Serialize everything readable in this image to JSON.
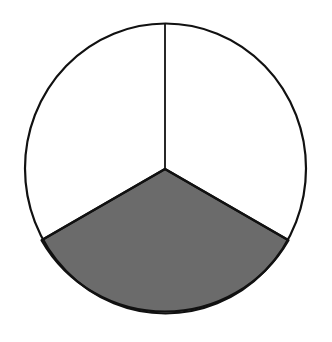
{
  "diagram": {
    "type": "fraction-circle",
    "total_parts": 3,
    "shaded_parts": 1,
    "fraction": "1/3",
    "shaded_sector": "bottom",
    "colors": {
      "shaded": "#6b6b6b",
      "unshaded": "#ffffff",
      "stroke": "#111111"
    }
  }
}
